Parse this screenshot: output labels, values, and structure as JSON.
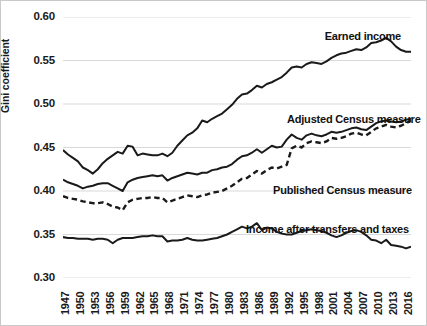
{
  "chart_data": {
    "type": "line",
    "title": "",
    "xlabel": "",
    "ylabel": "Gini coefficient",
    "ylim": [
      0.3,
      0.6
    ],
    "ytick_labels": [
      "0.60",
      "0.55",
      "0.50",
      "0.45",
      "0.40",
      "0.35",
      "0.30"
    ],
    "ytick_values": [
      0.6,
      0.55,
      0.5,
      0.45,
      0.4,
      0.35,
      0.3
    ],
    "xlim": [
      1947,
      2017
    ],
    "xtick_labels": [
      "1947",
      "1950",
      "1953",
      "1956",
      "1959",
      "1962",
      "1965",
      "1968",
      "1971",
      "1974",
      "1977",
      "1980",
      "1983",
      "1986",
      "1989",
      "1992",
      "1995",
      "1998",
      "2001",
      "2004",
      "2007",
      "2010",
      "2013",
      "2016"
    ],
    "xtick_values": [
      1947,
      1950,
      1953,
      1956,
      1959,
      1962,
      1965,
      1968,
      1971,
      1974,
      1977,
      1980,
      1983,
      1986,
      1989,
      1992,
      1995,
      1998,
      2001,
      2004,
      2007,
      2010,
      2013,
      2016
    ],
    "grid": "horizontal",
    "legend_position": "inline-annotations",
    "line_color": "#1a1a1a",
    "grid_color": "#d9d9d9",
    "x": [
      1947,
      1948,
      1949,
      1950,
      1951,
      1952,
      1953,
      1954,
      1955,
      1956,
      1957,
      1958,
      1959,
      1960,
      1961,
      1962,
      1963,
      1964,
      1965,
      1966,
      1967,
      1968,
      1969,
      1970,
      1971,
      1972,
      1973,
      1974,
      1975,
      1976,
      1977,
      1978,
      1979,
      1980,
      1981,
      1982,
      1983,
      1984,
      1985,
      1986,
      1987,
      1988,
      1989,
      1990,
      1991,
      1992,
      1993,
      1994,
      1995,
      1996,
      1997,
      1998,
      1999,
      2000,
      2001,
      2002,
      2003,
      2004,
      2005,
      2006,
      2007,
      2008,
      2009,
      2010,
      2011,
      2012,
      2013,
      2014,
      2015,
      2016,
      2017
    ],
    "series": [
      {
        "name": "Earned income",
        "style": "solid",
        "annotation_label": "Earned income",
        "values": [
          0.447,
          0.442,
          0.438,
          0.434,
          0.427,
          0.424,
          0.42,
          0.425,
          0.432,
          0.437,
          0.441,
          0.445,
          0.443,
          0.452,
          0.451,
          0.441,
          0.443,
          0.442,
          0.441,
          0.441,
          0.443,
          0.44,
          0.444,
          0.452,
          0.458,
          0.464,
          0.467,
          0.472,
          0.481,
          0.479,
          0.483,
          0.486,
          0.489,
          0.494,
          0.499,
          0.506,
          0.511,
          0.512,
          0.516,
          0.521,
          0.519,
          0.523,
          0.525,
          0.528,
          0.531,
          0.536,
          0.542,
          0.543,
          0.542,
          0.546,
          0.548,
          0.547,
          0.546,
          0.549,
          0.553,
          0.556,
          0.558,
          0.559,
          0.561,
          0.563,
          0.562,
          0.565,
          0.57,
          0.571,
          0.573,
          0.576,
          0.572,
          0.566,
          0.562,
          0.56,
          0.56
        ]
      },
      {
        "name": "Adjusted Census measure",
        "style": "solid",
        "annotation_label": "Adjusted Census measure",
        "values": [
          0.413,
          0.41,
          0.408,
          0.406,
          0.403,
          0.405,
          0.406,
          0.408,
          0.409,
          0.409,
          0.406,
          0.403,
          0.4,
          0.41,
          0.413,
          0.415,
          0.416,
          0.417,
          0.418,
          0.417,
          0.418,
          0.412,
          0.415,
          0.417,
          0.419,
          0.421,
          0.42,
          0.419,
          0.421,
          0.421,
          0.424,
          0.425,
          0.427,
          0.428,
          0.431,
          0.436,
          0.44,
          0.441,
          0.444,
          0.448,
          0.444,
          0.448,
          0.452,
          0.45,
          0.451,
          0.459,
          0.465,
          0.461,
          0.459,
          0.464,
          0.466,
          0.464,
          0.463,
          0.465,
          0.468,
          0.467,
          0.468,
          0.47,
          0.472,
          0.473,
          0.471,
          0.47,
          0.474,
          0.478,
          0.48,
          0.481,
          0.48,
          0.479,
          0.48,
          0.482,
          0.483
        ]
      },
      {
        "name": "Published Census measure",
        "style": "dashed",
        "annotation_label": "Published Census measure",
        "values": [
          0.394,
          0.392,
          0.391,
          0.39,
          0.388,
          0.387,
          0.386,
          0.386,
          0.387,
          0.385,
          0.382,
          0.381,
          0.378,
          0.387,
          0.39,
          0.391,
          0.392,
          0.392,
          0.393,
          0.392,
          0.392,
          0.387,
          0.389,
          0.391,
          0.393,
          0.395,
          0.394,
          0.393,
          0.395,
          0.396,
          0.398,
          0.399,
          0.4,
          0.403,
          0.406,
          0.41,
          0.414,
          0.415,
          0.419,
          0.423,
          0.42,
          0.424,
          0.427,
          0.426,
          0.428,
          0.43,
          0.449,
          0.452,
          0.45,
          0.455,
          0.457,
          0.456,
          0.455,
          0.457,
          0.461,
          0.46,
          0.461,
          0.463,
          0.466,
          0.467,
          0.465,
          0.464,
          0.468,
          0.472,
          0.474,
          0.476,
          0.474,
          0.473,
          0.475,
          0.478,
          0.481
        ]
      },
      {
        "name": "Income after transfers and taxes",
        "style": "solid",
        "annotation_label": "Income after transfers and taxes",
        "values": [
          0.347,
          0.346,
          0.346,
          0.345,
          0.345,
          0.345,
          0.344,
          0.345,
          0.345,
          0.344,
          0.34,
          0.344,
          0.346,
          0.346,
          0.346,
          0.347,
          0.348,
          0.348,
          0.349,
          0.348,
          0.348,
          0.342,
          0.343,
          0.343,
          0.344,
          0.346,
          0.344,
          0.343,
          0.343,
          0.344,
          0.345,
          0.346,
          0.348,
          0.35,
          0.353,
          0.356,
          0.359,
          0.357,
          0.359,
          0.363,
          0.355,
          0.358,
          0.357,
          0.353,
          0.351,
          0.35,
          0.35,
          0.352,
          0.354,
          0.355,
          0.356,
          0.355,
          0.354,
          0.352,
          0.349,
          0.347,
          0.349,
          0.352,
          0.354,
          0.355,
          0.353,
          0.349,
          0.344,
          0.343,
          0.34,
          0.344,
          0.338,
          0.337,
          0.336,
          0.334,
          0.336
        ]
      }
    ]
  }
}
